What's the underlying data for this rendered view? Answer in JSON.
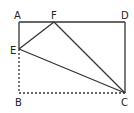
{
  "diagram": {
    "type": "geometry-rectangle-fold",
    "points": {
      "A": {
        "label": "A",
        "x": 19,
        "y": 22
      },
      "D": {
        "label": "D",
        "x": 125,
        "y": 22
      },
      "F": {
        "label": "F",
        "x": 54,
        "y": 22
      },
      "E": {
        "label": "E",
        "x": 19,
        "y": 49
      },
      "B": {
        "label": "B",
        "x": 19,
        "y": 93
      },
      "C": {
        "label": "C",
        "x": 125,
        "y": 93
      }
    },
    "solid_segments": [
      "AD",
      "DC",
      "AE",
      "EF",
      "FC",
      "EC"
    ],
    "dashed_segments": [
      "EB",
      "BC"
    ],
    "line_color": "#333333"
  }
}
